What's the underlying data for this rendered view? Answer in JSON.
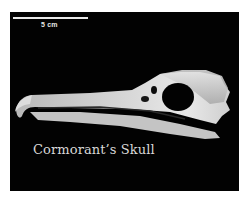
{
  "image": {
    "subject": "Cormorant skull, lateral view",
    "background_color": "#020202",
    "scale_bar": {
      "label": "5 cm",
      "color": "#e8e8e8"
    },
    "caption": "Cormorant’s Skull"
  }
}
